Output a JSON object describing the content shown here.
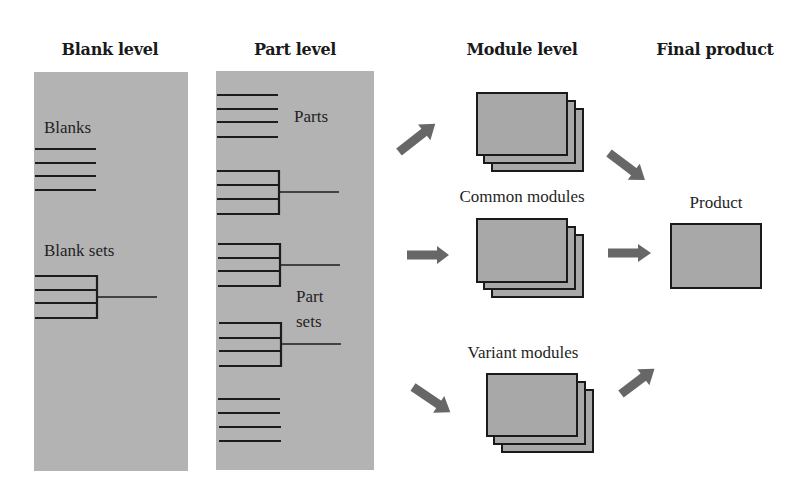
{
  "headings": {
    "blank_level": "Blank level",
    "part_level": "Part level",
    "module_level": "Module level",
    "final_product": "Final product"
  },
  "blank_panel": {
    "blanks_label": "Blanks",
    "blank_sets_label": "Blank sets"
  },
  "part_panel": {
    "parts_label": "Parts",
    "part_sets_label_line1": "Part",
    "part_sets_label_line2": "sets"
  },
  "modules": {
    "common_label": "Common modules",
    "variant_label": "Variant modules"
  },
  "product": {
    "label": "Product"
  },
  "colors": {
    "panel": "#b3b3b3",
    "card": "#a8a8a8",
    "arrow": "#676767",
    "line": "#1c1c1c"
  }
}
